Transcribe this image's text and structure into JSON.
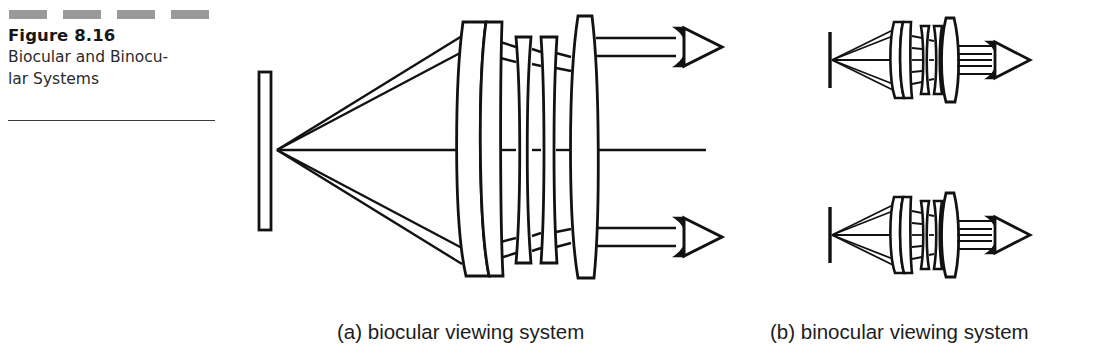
{
  "figure": {
    "number_label": "Figure 8.16",
    "title": "Biocular and Binocu-\nlar Systems",
    "title_line1": "Biocular and Binocu-",
    "title_line2": "lar Systems",
    "decorative_dashes": 4,
    "rule_color": "#3a3a3a",
    "dash_color": "#9a9a9a"
  },
  "subcaptions": {
    "a": "(a) biocular viewing system",
    "b": "(b) binocular viewing system"
  },
  "diagram": {
    "ink_color": "#121212",
    "background": "#ffffff",
    "panel_a": {
      "name": "biocular viewing system",
      "components": [
        "display-screen",
        "ray-bundle-upper",
        "ray-bundle-axial",
        "ray-bundle-lower",
        "objective-doublet-lens",
        "field-lens-group",
        "eyepiece-lens",
        "eye-upper",
        "eye-lower"
      ],
      "eye_count": 2,
      "lens_count": 4
    },
    "panel_b": {
      "name": "binocular viewing system",
      "channels": 2,
      "components_per_channel": [
        "display-screen",
        "ray-bundle",
        "objective-doublet-lens",
        "field-lens-group",
        "eyepiece-lens",
        "eye"
      ]
    }
  }
}
